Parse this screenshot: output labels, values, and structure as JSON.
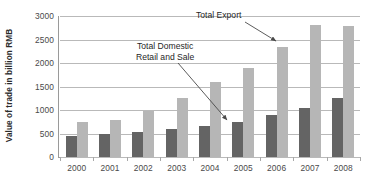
{
  "chart_data": {
    "type": "bar",
    "title": "",
    "xlabel": "",
    "ylabel": "Value of trade in billion RMB",
    "categories": [
      "2000",
      "2001",
      "2002",
      "2003",
      "2004",
      "2005",
      "2006",
      "2007",
      "2008"
    ],
    "series": [
      {
        "name": "Total Domestic Retail and Sale",
        "color": "#646464",
        "values": [
          450,
          490,
          530,
          600,
          670,
          750,
          890,
          1050,
          1250
        ]
      },
      {
        "name": "Total Export",
        "color": "#b6b6b6",
        "values": [
          750,
          780,
          980,
          1250,
          1600,
          1900,
          2350,
          2800,
          2790
        ]
      }
    ],
    "ylim": [
      0,
      3000
    ],
    "yticks": [
      "0",
      "500",
      "1000",
      "1500",
      "2000",
      "2500",
      "3000"
    ],
    "grid": true,
    "legend": "none",
    "annotations": [
      {
        "id": "total-export",
        "text": "Total Export",
        "points_to": "2006 Total Export bar"
      },
      {
        "id": "total-domestic",
        "line1": "Total Domestic",
        "line2": "Retail and Sale",
        "points_to": "2005 Total Domestic Retail and Sale bar"
      }
    ]
  }
}
